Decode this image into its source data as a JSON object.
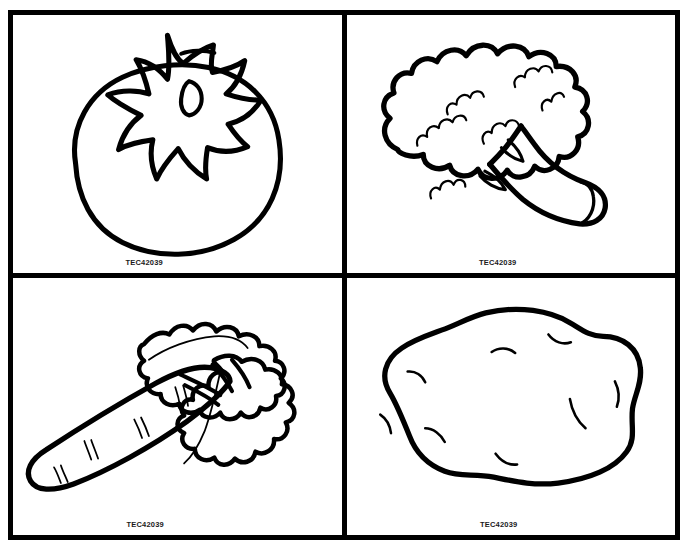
{
  "page": {
    "background_color": "#ffffff",
    "ink_color": "#000000",
    "top_remnant_text": "",
    "layout": "2x2 grid of bordered coloring panels",
    "border_color": "#000000",
    "border_width_px": 5
  },
  "panels": [
    {
      "id": "tomato",
      "subject": "tomato",
      "subject_label": "Tomato with star-shaped calyx",
      "label": "TEC42039",
      "row": 1,
      "column": 1
    },
    {
      "id": "broccoli",
      "subject": "broccoli",
      "subject_label": "Broccoli floret head with thick stalk",
      "label": "TEC42039",
      "row": 1,
      "column": 2
    },
    {
      "id": "carrot",
      "subject": "carrot",
      "subject_label": "Carrot with leafy green tops",
      "label": "TEC42039",
      "row": 2,
      "column": 1
    },
    {
      "id": "potato",
      "subject": "potato",
      "subject_label": "Potato with eye marks",
      "label": "TEC42039",
      "row": 2,
      "column": 2
    }
  ]
}
